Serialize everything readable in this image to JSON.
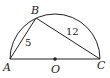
{
  "diagram": {
    "type": "semicircle-inscribed-triangle",
    "points": {
      "A": {
        "label": "A",
        "x": 10,
        "y": 59
      },
      "B": {
        "label": "B",
        "x": 36,
        "y": 18
      },
      "C": {
        "label": "C",
        "x": 100,
        "y": 59
      },
      "O": {
        "label": "O",
        "x": 55,
        "y": 59
      }
    },
    "segments": [
      {
        "from": "A",
        "to": "B",
        "length_label": "5"
      },
      {
        "from": "B",
        "to": "C",
        "length_label": "12"
      },
      {
        "from": "A",
        "to": "C",
        "length_label": ""
      }
    ],
    "labels": {
      "A": "A",
      "B": "B",
      "C": "C",
      "O": "O",
      "AB": "5",
      "BC": "12"
    },
    "colors": {
      "stroke": "#222222",
      "background": "#ffffff"
    }
  }
}
